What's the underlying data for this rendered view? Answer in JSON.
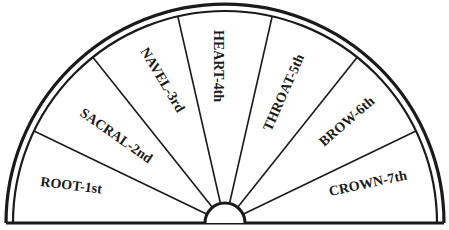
{
  "diagram": {
    "type": "semicircle-sector-chart",
    "colors": {
      "stroke": "#1a1a1a",
      "background": "#ffffff"
    },
    "sectors": [
      {
        "label": "ROOT-1st"
      },
      {
        "label": "SACRAL-2nd"
      },
      {
        "label": "NAVEL-3rd"
      },
      {
        "label": "HEART-4th"
      },
      {
        "label": "THROAT-5th"
      },
      {
        "label": "BROW-6th"
      },
      {
        "label": "CROWN-7th"
      }
    ]
  }
}
